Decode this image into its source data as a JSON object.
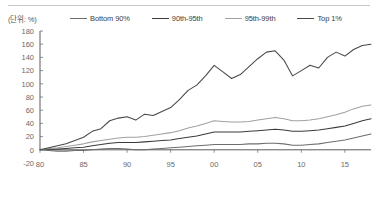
{
  "unit_label": "(단위: %)",
  "legend": {
    "items": [
      {
        "label": "Bottom 90%",
        "color": "#6e6e6e"
      },
      {
        "label": "90th-95th",
        "color": "#3b3b3b"
      },
      {
        "label": "95th-99th",
        "color": "#a0a0a0"
      },
      {
        "label": "Top 1%",
        "color": "#474747"
      }
    ]
  },
  "axis": {
    "y_ticks": [
      "180",
      "160",
      "140",
      "120",
      "100",
      "80",
      "60",
      "40",
      "20",
      "0",
      "-20"
    ],
    "x_ticks": [
      "80",
      "85",
      "90",
      "95",
      "00",
      "05",
      "10",
      "15"
    ]
  },
  "chart_data": {
    "type": "line",
    "title": "",
    "xlabel": "",
    "ylabel": "(단위: %)",
    "ylim": [
      -20,
      180
    ],
    "xlim": [
      1980,
      2018
    ],
    "grid": false,
    "legend_position": "top",
    "x": [
      1980,
      1981,
      1982,
      1983,
      1984,
      1985,
      1986,
      1987,
      1988,
      1989,
      1990,
      1991,
      1992,
      1993,
      1994,
      1995,
      1996,
      1997,
      1998,
      1999,
      2000,
      2001,
      2002,
      2003,
      2004,
      2005,
      2006,
      2007,
      2008,
      2009,
      2010,
      2011,
      2012,
      2013,
      2014,
      2015,
      2016,
      2017,
      2018
    ],
    "series": [
      {
        "name": "Bottom 90%",
        "color": "#6e6e6e",
        "values": [
          0,
          -1,
          -2,
          -2,
          -1,
          -1,
          0,
          1,
          2,
          2,
          1,
          0,
          0,
          1,
          2,
          3,
          4,
          5,
          6,
          7,
          8,
          8,
          8,
          8,
          9,
          9,
          10,
          10,
          9,
          7,
          7,
          8,
          9,
          11,
          13,
          15,
          18,
          21,
          24
        ]
      },
      {
        "name": "90th-95th",
        "color": "#3b3b3b",
        "values": [
          0,
          1,
          1,
          2,
          3,
          4,
          6,
          8,
          10,
          11,
          11,
          11,
          12,
          13,
          14,
          15,
          17,
          19,
          21,
          24,
          27,
          27,
          27,
          27,
          28,
          29,
          30,
          31,
          30,
          28,
          28,
          29,
          30,
          32,
          34,
          36,
          40,
          44,
          47
        ]
      },
      {
        "name": "95th-99th",
        "color": "#a0a0a0",
        "values": [
          0,
          2,
          3,
          5,
          7,
          9,
          12,
          14,
          16,
          18,
          19,
          19,
          20,
          22,
          24,
          26,
          29,
          33,
          36,
          40,
          44,
          43,
          42,
          42,
          43,
          45,
          47,
          49,
          47,
          44,
          44,
          45,
          47,
          50,
          53,
          57,
          62,
          66,
          68
        ]
      },
      {
        "name": "Top 1%",
        "color": "#474747",
        "values": [
          0,
          3,
          6,
          9,
          14,
          19,
          28,
          32,
          44,
          48,
          50,
          45,
          54,
          52,
          58,
          64,
          76,
          90,
          98,
          112,
          128,
          118,
          108,
          114,
          126,
          138,
          148,
          150,
          136,
          112,
          120,
          128,
          124,
          140,
          148,
          142,
          152,
          158,
          160
        ]
      }
    ]
  }
}
